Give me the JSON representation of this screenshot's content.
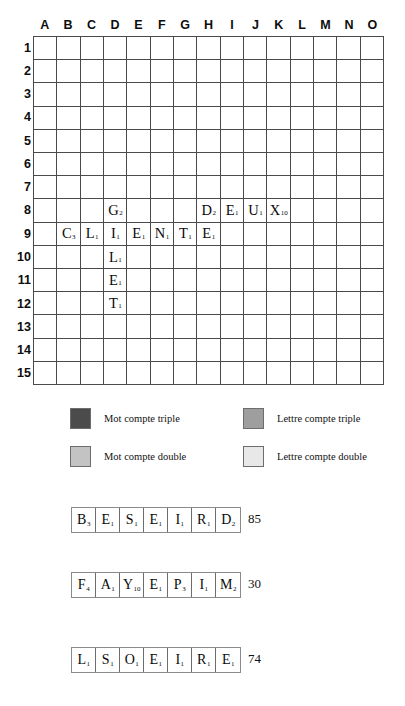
{
  "board": {
    "column_headers": [
      "A",
      "B",
      "C",
      "D",
      "E",
      "F",
      "G",
      "H",
      "I",
      "J",
      "K",
      "L",
      "M",
      "N",
      "O"
    ],
    "row_headers": [
      "1",
      "2",
      "3",
      "4",
      "5",
      "6",
      "7",
      "8",
      "9",
      "10",
      "11",
      "12",
      "13",
      "14",
      "15"
    ],
    "premium_colors": {
      "triple_word": "#4b4b4b",
      "double_word": "#c3c3c3",
      "triple_letter": "#9e9e9e",
      "double_letter": "#e8e8e8",
      "plain": "#ffffff"
    },
    "squares": [
      [
        "tw",
        "no",
        "no",
        "dl",
        "no",
        "no",
        "no",
        "tw",
        "no",
        "no",
        "no",
        "dl",
        "no",
        "no",
        "tw"
      ],
      [
        "no",
        "dw",
        "no",
        "no",
        "no",
        "tl",
        "no",
        "no",
        "no",
        "tl",
        "no",
        "no",
        "no",
        "dw",
        "no"
      ],
      [
        "no",
        "no",
        "dw",
        "no",
        "no",
        "no",
        "dl",
        "no",
        "dl",
        "no",
        "no",
        "no",
        "dw",
        "no",
        "no"
      ],
      [
        "dl",
        "no",
        "no",
        "dw",
        "no",
        "no",
        "no",
        "dl",
        "no",
        "no",
        "no",
        "dw",
        "no",
        "no",
        "dl"
      ],
      [
        "no",
        "no",
        "no",
        "no",
        "dw",
        "no",
        "no",
        "no",
        "no",
        "no",
        "dw",
        "no",
        "no",
        "no",
        "no"
      ],
      [
        "no",
        "tl",
        "no",
        "no",
        "no",
        "tl",
        "no",
        "no",
        "no",
        "tl",
        "no",
        "no",
        "no",
        "tl",
        "no"
      ],
      [
        "no",
        "no",
        "dl",
        "no",
        "no",
        "no",
        "dl",
        "no",
        "dl",
        "no",
        "no",
        "no",
        "dl",
        "no",
        "no"
      ],
      [
        "tw",
        "no",
        "no",
        "dl",
        "no",
        "no",
        "no",
        "dw",
        "no",
        "no",
        "no",
        "dl",
        "no",
        "no",
        "tw"
      ],
      [
        "no",
        "no",
        "dl",
        "no",
        "no",
        "no",
        "dl",
        "no",
        "dl",
        "no",
        "no",
        "no",
        "dl",
        "no",
        "no"
      ],
      [
        "no",
        "tl",
        "no",
        "no",
        "no",
        "tl",
        "no",
        "no",
        "no",
        "tl",
        "no",
        "no",
        "no",
        "tl",
        "no"
      ],
      [
        "no",
        "no",
        "no",
        "no",
        "dw",
        "no",
        "no",
        "no",
        "no",
        "no",
        "dw",
        "no",
        "no",
        "no",
        "no"
      ],
      [
        "dl",
        "no",
        "no",
        "dw",
        "no",
        "no",
        "no",
        "dl",
        "no",
        "no",
        "no",
        "dw",
        "no",
        "no",
        "dl"
      ],
      [
        "no",
        "no",
        "dw",
        "no",
        "no",
        "no",
        "dl",
        "no",
        "dl",
        "no",
        "no",
        "no",
        "dw",
        "no",
        "no"
      ],
      [
        "no",
        "dw",
        "no",
        "no",
        "no",
        "tl",
        "no",
        "no",
        "no",
        "tl",
        "no",
        "no",
        "no",
        "dw",
        "no"
      ],
      [
        "tw",
        "no",
        "no",
        "dl",
        "no",
        "no",
        "no",
        "tw",
        "no",
        "no",
        "no",
        "dl",
        "no",
        "no",
        "tw"
      ]
    ],
    "tiles": [
      {
        "row": 8,
        "col": "D",
        "letter": "G",
        "points": "2"
      },
      {
        "row": 8,
        "col": "H",
        "letter": "D",
        "points": "2"
      },
      {
        "row": 8,
        "col": "I",
        "letter": "E",
        "points": "1"
      },
      {
        "row": 8,
        "col": "J",
        "letter": "U",
        "points": "1"
      },
      {
        "row": 8,
        "col": "K",
        "letter": "X",
        "points": "10"
      },
      {
        "row": 9,
        "col": "B",
        "letter": "C",
        "points": "3"
      },
      {
        "row": 9,
        "col": "C",
        "letter": "L",
        "points": "1"
      },
      {
        "row": 9,
        "col": "D",
        "letter": "I",
        "points": "1"
      },
      {
        "row": 9,
        "col": "E",
        "letter": "E",
        "points": "1"
      },
      {
        "row": 9,
        "col": "F",
        "letter": "N",
        "points": "1"
      },
      {
        "row": 9,
        "col": "G",
        "letter": "T",
        "points": "1"
      },
      {
        "row": 9,
        "col": "H",
        "letter": "E",
        "points": "1"
      },
      {
        "row": 10,
        "col": "D",
        "letter": "L",
        "points": "1"
      },
      {
        "row": 11,
        "col": "D",
        "letter": "E",
        "points": "1"
      },
      {
        "row": 12,
        "col": "D",
        "letter": "T",
        "points": "1"
      }
    ]
  },
  "legend": {
    "mot_compte_triple": "Mot compte triple",
    "lettre_compte_triple": "Lettre compte triple",
    "mot_compte_double": "Mot compte double",
    "lettre_compte_double": "Lettre compte double"
  },
  "racks": [
    {
      "tiles": [
        {
          "letter": "B",
          "points": "3"
        },
        {
          "letter": "E",
          "points": "1"
        },
        {
          "letter": "S",
          "points": "1"
        },
        {
          "letter": "E",
          "points": "1"
        },
        {
          "letter": "I",
          "points": "1"
        },
        {
          "letter": "R",
          "points": "1"
        },
        {
          "letter": "D",
          "points": "2"
        }
      ],
      "score": "85"
    },
    {
      "tiles": [
        {
          "letter": "F",
          "points": "4"
        },
        {
          "letter": "A",
          "points": "1"
        },
        {
          "letter": "Y",
          "points": "10"
        },
        {
          "letter": "E",
          "points": "1"
        },
        {
          "letter": "P",
          "points": "3"
        },
        {
          "letter": "I",
          "points": "1"
        },
        {
          "letter": "M",
          "points": "2"
        }
      ],
      "score": "30"
    },
    {
      "tiles": [
        {
          "letter": "L",
          "points": "1"
        },
        {
          "letter": "S",
          "points": "1"
        },
        {
          "letter": "O",
          "points": "1"
        },
        {
          "letter": "E",
          "points": "1"
        },
        {
          "letter": "I",
          "points": "1"
        },
        {
          "letter": "R",
          "points": "1"
        },
        {
          "letter": "E",
          "points": "1"
        }
      ],
      "score": "74"
    }
  ]
}
